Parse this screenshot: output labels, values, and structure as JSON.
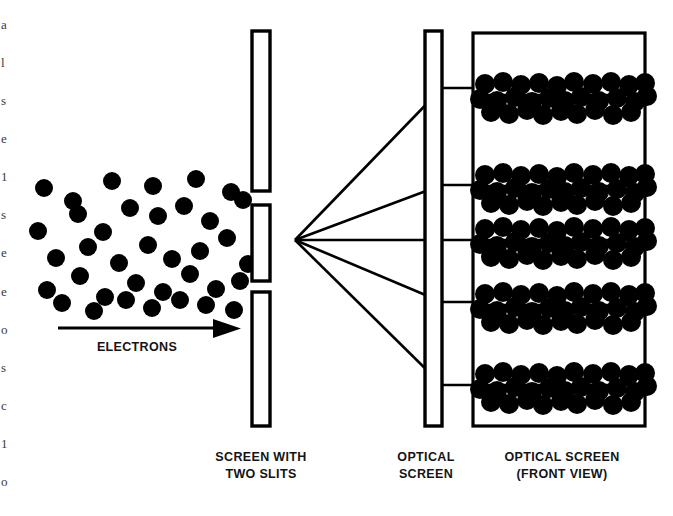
{
  "figure": {
    "kind": "physics-diagram",
    "background_color": "#ffffff",
    "ink_color": "#000000"
  },
  "labels": {
    "electrons": "ELECTRONS",
    "screen_with_slits_line1": "SCREEN WITH",
    "screen_with_slits_line2": "TWO SLITS",
    "optical_screen_line1": "OPTICAL",
    "optical_screen_line2": "SCREEN",
    "optical_screen_front_line1": "OPTICAL SCREEN",
    "optical_screen_front_line2": "(FRONT VIEW)"
  },
  "edge_text_fragments": [
    "a",
    "l",
    "s",
    "e",
    "1",
    "s",
    "e",
    "e",
    "o",
    "s",
    "c",
    "1",
    "o"
  ],
  "source_beam": {
    "name": "electron-cloud",
    "dot_count": 37,
    "dot_radius": 9,
    "dots": [
      [
        44,
        188
      ],
      [
        73,
        201
      ],
      [
        112,
        181
      ],
      [
        153,
        186
      ],
      [
        196,
        179
      ],
      [
        231,
        192
      ],
      [
        38,
        231
      ],
      [
        78,
        214
      ],
      [
        103,
        232
      ],
      [
        130,
        208
      ],
      [
        158,
        216
      ],
      [
        184,
        206
      ],
      [
        210,
        221
      ],
      [
        243,
        200
      ],
      [
        56,
        258
      ],
      [
        88,
        247
      ],
      [
        119,
        263
      ],
      [
        148,
        245
      ],
      [
        172,
        259
      ],
      [
        200,
        251
      ],
      [
        227,
        238
      ],
      [
        248,
        264
      ],
      [
        47,
        290
      ],
      [
        80,
        276
      ],
      [
        105,
        297
      ],
      [
        136,
        283
      ],
      [
        163,
        292
      ],
      [
        190,
        274
      ],
      [
        216,
        289
      ],
      [
        240,
        281
      ],
      [
        62,
        303
      ],
      [
        94,
        311
      ],
      [
        126,
        300
      ],
      [
        152,
        308
      ],
      [
        180,
        300
      ],
      [
        206,
        305
      ],
      [
        234,
        310
      ]
    ]
  },
  "barrier": {
    "name": "screen-with-two-slits",
    "x": 252,
    "width": 18,
    "segments": [
      {
        "name": "barrier-top-segment",
        "y": 31,
        "height": 160
      },
      {
        "name": "barrier-middle-segment",
        "y": 205,
        "height": 76
      },
      {
        "name": "barrier-bottom-segment",
        "y": 292,
        "height": 134
      }
    ],
    "slits": [
      {
        "name": "upper-slit",
        "y": 191,
        "height": 14
      },
      {
        "name": "lower-slit",
        "y": 281,
        "height": 11
      }
    ],
    "slit_origin": [
      295,
      240
    ]
  },
  "optical_screen_edge": {
    "name": "optical-screen-edge-view",
    "x": 425,
    "y": 31,
    "width": 17,
    "height": 395
  },
  "rays": {
    "name": "diffracted-ray-fan",
    "origin_x": 295,
    "origin_y": 240,
    "targets_y": [
      88,
      185,
      240,
      302,
      385
    ]
  },
  "front_view": {
    "name": "optical-screen-front-view",
    "box": {
      "x": 473,
      "y": 33,
      "width": 172,
      "height": 393
    },
    "fringe_count": 5,
    "fringes": [
      {
        "name": "fringe-band-1",
        "line_y": 95,
        "label": "first-order-upper"
      },
      {
        "name": "fringe-band-2",
        "line_y": 186,
        "label": "first-order-inner-upper"
      },
      {
        "name": "fringe-band-3",
        "line_y": 240,
        "label": "central-maximum"
      },
      {
        "name": "fringe-band-4",
        "line_y": 305,
        "label": "first-order-inner-lower"
      },
      {
        "name": "fringe-band-5",
        "line_y": 385,
        "label": "first-order-lower"
      }
    ],
    "dot_radius": 10,
    "band_dot_offsets": [
      [
        8,
        -11
      ],
      [
        26,
        -13
      ],
      [
        44,
        -10
      ],
      [
        62,
        -12
      ],
      [
        80,
        -9
      ],
      [
        97,
        -13
      ],
      [
        116,
        -11
      ],
      [
        134,
        -13
      ],
      [
        152,
        -10
      ],
      [
        168,
        -12
      ],
      [
        3,
        4
      ],
      [
        20,
        6
      ],
      [
        38,
        2
      ],
      [
        55,
        7
      ],
      [
        72,
        3
      ],
      [
        88,
        6
      ],
      [
        104,
        2
      ],
      [
        122,
        6
      ],
      [
        140,
        3
      ],
      [
        158,
        7
      ],
      [
        170,
        1
      ],
      [
        14,
        17
      ],
      [
        32,
        19
      ],
      [
        50,
        15
      ],
      [
        66,
        20
      ],
      [
        84,
        16
      ],
      [
        100,
        19
      ],
      [
        118,
        15
      ],
      [
        136,
        20
      ],
      [
        154,
        17
      ]
    ]
  }
}
